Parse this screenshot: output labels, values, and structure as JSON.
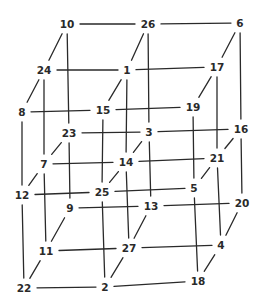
{
  "diagram": {
    "type": "3x3x3 cube lattice",
    "line_color": "#2a2a2a",
    "background": "#ffffff",
    "nodes": [
      {
        "id": "n10",
        "label": "10",
        "layer": "top",
        "row": "back",
        "col": 0,
        "x": 67,
        "y": 24
      },
      {
        "id": "n26",
        "label": "26",
        "layer": "top",
        "row": "back",
        "col": 1,
        "x": 148,
        "y": 24
      },
      {
        "id": "n6",
        "label": "6",
        "layer": "top",
        "row": "back",
        "col": 2,
        "x": 240,
        "y": 23
      },
      {
        "id": "n24",
        "label": "24",
        "layer": "top",
        "row": "middle",
        "col": 0,
        "x": 44,
        "y": 70
      },
      {
        "id": "n1",
        "label": "1",
        "layer": "top",
        "row": "middle",
        "col": 1,
        "x": 127,
        "y": 70
      },
      {
        "id": "n17",
        "label": "17",
        "layer": "top",
        "row": "middle",
        "col": 2,
        "x": 217,
        "y": 67
      },
      {
        "id": "n8",
        "label": "8",
        "layer": "top",
        "row": "front",
        "col": 0,
        "x": 22,
        "y": 112
      },
      {
        "id": "n15",
        "label": "15",
        "layer": "top",
        "row": "front",
        "col": 1,
        "x": 103,
        "y": 110
      },
      {
        "id": "n19",
        "label": "19",
        "layer": "top",
        "row": "front",
        "col": 2,
        "x": 193,
        "y": 107
      },
      {
        "id": "n23",
        "label": "23",
        "layer": "middle",
        "row": "back",
        "col": 0,
        "x": 69,
        "y": 133
      },
      {
        "id": "n3",
        "label": "3",
        "layer": "middle",
        "row": "back",
        "col": 1,
        "x": 149,
        "y": 132
      },
      {
        "id": "n16",
        "label": "16",
        "layer": "middle",
        "row": "back",
        "col": 2,
        "x": 241,
        "y": 129
      },
      {
        "id": "n7",
        "label": "7",
        "layer": "middle",
        "row": "middle",
        "col": 0,
        "x": 44,
        "y": 164
      },
      {
        "id": "n14",
        "label": "14",
        "layer": "middle",
        "row": "middle",
        "col": 1,
        "x": 126,
        "y": 162
      },
      {
        "id": "n21",
        "label": "21",
        "layer": "middle",
        "row": "middle",
        "col": 2,
        "x": 217,
        "y": 158
      },
      {
        "id": "n12",
        "label": "12",
        "layer": "middle",
        "row": "front",
        "col": 0,
        "x": 22,
        "y": 195
      },
      {
        "id": "n25",
        "label": "25",
        "layer": "middle",
        "row": "front",
        "col": 1,
        "x": 102,
        "y": 192
      },
      {
        "id": "n5",
        "label": "5",
        "layer": "middle",
        "row": "front",
        "col": 2,
        "x": 194,
        "y": 188
      },
      {
        "id": "n9",
        "label": "9",
        "layer": "bottom",
        "row": "back",
        "col": 0,
        "x": 70,
        "y": 208
      },
      {
        "id": "n13",
        "label": "13",
        "layer": "bottom",
        "row": "back",
        "col": 1,
        "x": 151,
        "y": 206
      },
      {
        "id": "n20",
        "label": "20",
        "layer": "bottom",
        "row": "back",
        "col": 2,
        "x": 242,
        "y": 203
      },
      {
        "id": "n11",
        "label": "11",
        "layer": "bottom",
        "row": "middle",
        "col": 0,
        "x": 46,
        "y": 251
      },
      {
        "id": "n27",
        "label": "27",
        "layer": "bottom",
        "row": "middle",
        "col": 1,
        "x": 129,
        "y": 248
      },
      {
        "id": "n4",
        "label": "4",
        "layer": "bottom",
        "row": "middle",
        "col": 2,
        "x": 221,
        "y": 245
      },
      {
        "id": "n22",
        "label": "22",
        "layer": "bottom",
        "row": "front",
        "col": 0,
        "x": 24,
        "y": 288
      },
      {
        "id": "n2",
        "label": "2",
        "layer": "bottom",
        "row": "front",
        "col": 1,
        "x": 105,
        "y": 287
      },
      {
        "id": "n18",
        "label": "18",
        "layer": "bottom",
        "row": "front",
        "col": 2,
        "x": 198,
        "y": 281
      }
    ],
    "edges": [
      [
        "n10",
        "n26"
      ],
      [
        "n26",
        "n6"
      ],
      [
        "n24",
        "n1"
      ],
      [
        "n1",
        "n17"
      ],
      [
        "n8",
        "n15"
      ],
      [
        "n15",
        "n19"
      ],
      [
        "n23",
        "n3"
      ],
      [
        "n3",
        "n16"
      ],
      [
        "n7",
        "n14"
      ],
      [
        "n14",
        "n21"
      ],
      [
        "n12",
        "n25"
      ],
      [
        "n25",
        "n5"
      ],
      [
        "n9",
        "n13"
      ],
      [
        "n13",
        "n20"
      ],
      [
        "n11",
        "n27"
      ],
      [
        "n27",
        "n4"
      ],
      [
        "n22",
        "n2"
      ],
      [
        "n2",
        "n18"
      ],
      [
        "n10",
        "n23"
      ],
      [
        "n23",
        "n9"
      ],
      [
        "n26",
        "n3"
      ],
      [
        "n3",
        "n13"
      ],
      [
        "n6",
        "n16"
      ],
      [
        "n16",
        "n20"
      ],
      [
        "n24",
        "n7"
      ],
      [
        "n7",
        "n11"
      ],
      [
        "n1",
        "n14"
      ],
      [
        "n14",
        "n27"
      ],
      [
        "n17",
        "n21"
      ],
      [
        "n21",
        "n4"
      ],
      [
        "n8",
        "n12"
      ],
      [
        "n12",
        "n22"
      ],
      [
        "n15",
        "n25"
      ],
      [
        "n25",
        "n2"
      ],
      [
        "n19",
        "n5"
      ],
      [
        "n5",
        "n18"
      ],
      [
        "n10",
        "n24"
      ],
      [
        "n24",
        "n8"
      ],
      [
        "n26",
        "n1"
      ],
      [
        "n1",
        "n15"
      ],
      [
        "n6",
        "n17"
      ],
      [
        "n17",
        "n19"
      ],
      [
        "n23",
        "n7"
      ],
      [
        "n7",
        "n12"
      ],
      [
        "n3",
        "n14"
      ],
      [
        "n14",
        "n25"
      ],
      [
        "n16",
        "n21"
      ],
      [
        "n21",
        "n5"
      ],
      [
        "n9",
        "n11"
      ],
      [
        "n11",
        "n22"
      ],
      [
        "n13",
        "n27"
      ],
      [
        "n27",
        "n2"
      ],
      [
        "n20",
        "n4"
      ],
      [
        "n4",
        "n18"
      ]
    ]
  }
}
